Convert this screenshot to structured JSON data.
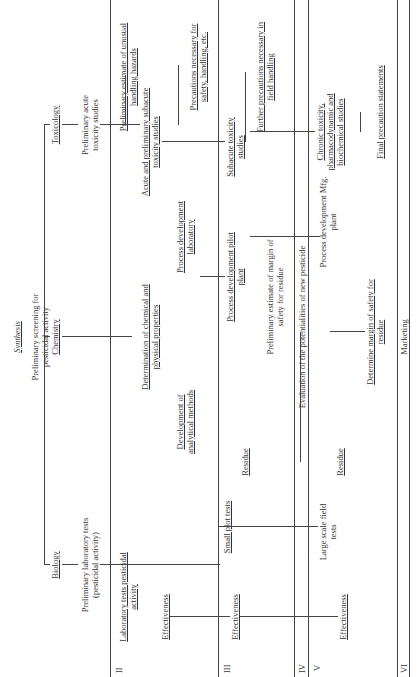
{
  "title": "Synthesis",
  "root": "Preliminary screening for pesticidal activity",
  "disciplines": [
    "Biology",
    "Chemistry",
    "Toxicology"
  ],
  "stages": {
    "I": {
      "biology": "Preliminary laboratory tests (pesticidal activity)",
      "toxicology": "Preliminary acute toxicity studies",
      "toxicology_hazard": "Preliminary estimate of unusual handling hazards"
    },
    "II": {
      "label": "II",
      "biology": "Laboratory tests pesticidal activity",
      "effectiveness": "Effectiveness",
      "chemistry_props": "Determination of chemical and physical properties",
      "analytical": "Development of analytical methods",
      "process_lab": "Process development laboratory",
      "acute_subacute": "Acute and preliminary subacute toxicity studies",
      "precautions": "Precautions necessary for safety, handling, etc."
    },
    "III": {
      "label": "III",
      "small_plot": "Small plot tests",
      "effectiveness": "Effectiveness",
      "residue": "Residue",
      "process_pilot": "Process development pilot plant",
      "margin_estimate": "Preliminary estimate of margin of safety for residue",
      "subacute": "Subacute toxicity studies",
      "field_precautions": "Further precautions necessary in field handling"
    },
    "IV": {
      "label": "IV",
      "evaluation": "Evaluation of the potentialities of new pesticide"
    },
    "V": {
      "label": "V",
      "large_scale": "Large scale field tests",
      "effectiveness": "Effectiveness",
      "residue": "Residue",
      "mfg_plant": "Process development Mfg. plant",
      "determine_margin": "Determine margin of safety for residue",
      "chronic": "Chronic toxicity, pharmacodynamic and biochemical studies",
      "final_precaution": "Final precaution statements"
    },
    "VI": {
      "label": "VI",
      "marketing": "Marketing"
    }
  }
}
